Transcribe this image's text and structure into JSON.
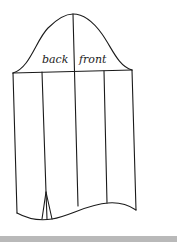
{
  "diagram": {
    "type": "sleeve-pattern",
    "labels": {
      "back": "back",
      "front": "front"
    },
    "line_color": "#1a1a1a",
    "footer_bar_color": "#b9b9b9"
  }
}
